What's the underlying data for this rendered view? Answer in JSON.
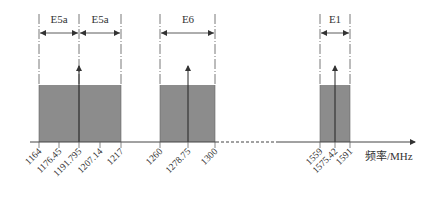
{
  "diagram": {
    "type": "frequency-band-allocation",
    "axis": {
      "label": "频率/MHz",
      "y": 142,
      "x_start": 30,
      "x_end": 415,
      "dashed_segment": [
        216,
        276
      ]
    },
    "colors": {
      "band_fill": "#8c8c8c",
      "line": "#333333"
    },
    "band_top_y": 85,
    "dimension_y": 33,
    "label_y": 23,
    "bands": [
      {
        "name": "E5a",
        "x1": 39,
        "x2": 79,
        "label_x": 59
      },
      {
        "name": "E5a",
        "x1": 79,
        "x2": 121,
        "label_x": 100
      },
      {
        "name": "E6",
        "x1": 160,
        "x2": 215,
        "label_x": 188
      },
      {
        "name": "E1",
        "x1": 320,
        "x2": 350,
        "label_x": 335
      }
    ],
    "filled_regions": [
      {
        "id": "e5",
        "x1": 39,
        "x2": 121
      },
      {
        "id": "e6",
        "x1": 160,
        "x2": 215
      },
      {
        "id": "e1",
        "x1": 320,
        "x2": 350
      }
    ],
    "center_arrows": [
      {
        "id": "e5-center",
        "x": 79,
        "tip_y": 66
      },
      {
        "id": "e6-center",
        "x": 188,
        "tip_y": 66
      },
      {
        "id": "e1-center",
        "x": 335,
        "tip_y": 66
      }
    ],
    "ticks": [
      {
        "label": "1164",
        "x": 39
      },
      {
        "label": "1176.45",
        "x": 59
      },
      {
        "label": "1191.795",
        "x": 79
      },
      {
        "label": "1207.14",
        "x": 100
      },
      {
        "label": "1217",
        "x": 121
      },
      {
        "label": "1260",
        "x": 160
      },
      {
        "label": "1278.75",
        "x": 188
      },
      {
        "label": "1300",
        "x": 215
      },
      {
        "label": "1559",
        "x": 320
      },
      {
        "label": "1575.42",
        "x": 335
      },
      {
        "label": "1591",
        "x": 350
      }
    ]
  }
}
